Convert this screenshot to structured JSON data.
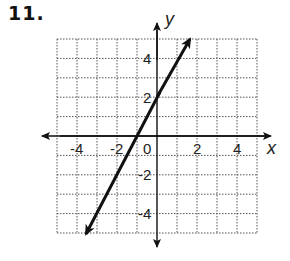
{
  "problem": {
    "number": "11."
  },
  "graph": {
    "x_axis_label": "x",
    "y_axis_label": "y",
    "x_tick_labels": [
      "-4",
      "-2",
      "0",
      "2",
      "4"
    ],
    "y_tick_labels": [
      "4",
      "2",
      "-2",
      "-4"
    ],
    "grid": {
      "xmin": -5,
      "xmax": 5,
      "ymin": -5,
      "ymax": 5,
      "step": 1
    },
    "line": {
      "equation": "y = 2x + 2",
      "slope": 2,
      "y_intercept": 2,
      "x_intercept": -1,
      "from": [
        -3.5,
        -5
      ],
      "to": [
        1.5,
        5
      ]
    }
  }
}
